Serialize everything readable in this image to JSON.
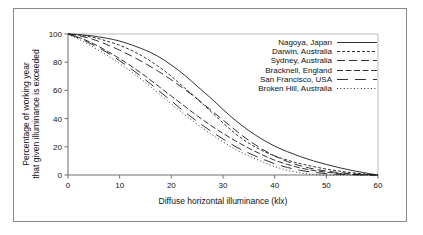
{
  "chart_data": {
    "type": "line",
    "title": "",
    "xlabel": "Diffuse horizontal illuminance (klx)",
    "ylabel_line1": "Percentage of working year",
    "ylabel_line2": "that given illuminance is exceeded",
    "xlim": [
      0,
      60
    ],
    "ylim": [
      0,
      100
    ],
    "xticks": [
      0,
      10,
      20,
      30,
      40,
      50,
      60
    ],
    "yticks": [
      0,
      20,
      40,
      60,
      80,
      100
    ],
    "grid": false,
    "legend_position": "top-right",
    "x": [
      0,
      2.5,
      5,
      7.5,
      10,
      12.5,
      15,
      17.5,
      20,
      22.5,
      25,
      27.5,
      30,
      32.5,
      35,
      37.5,
      40,
      42.5,
      45,
      47.5,
      50,
      52.5,
      55,
      57.5,
      60
    ],
    "series": [
      {
        "name": "Nagoya, Japan",
        "style": "solid",
        "dasharray": "",
        "values": [
          100,
          99.5,
          98.5,
          97,
          95,
          92,
          88.5,
          84,
          78,
          71,
          63,
          55,
          46.5,
          38.5,
          31.5,
          25.5,
          20.5,
          16.5,
          13,
          10,
          7.5,
          5.2,
          3.2,
          1.5,
          0
        ]
      },
      {
        "name": "Darwin, Australia",
        "style": "short-dash",
        "dasharray": "3,2",
        "values": [
          100,
          99,
          97.5,
          95,
          92,
          88,
          83,
          77,
          70,
          62,
          54,
          45.5,
          37,
          29,
          22.5,
          17.5,
          13.5,
          10.5,
          8,
          6,
          4.2,
          2.8,
          1.6,
          0.7,
          0
        ]
      },
      {
        "name": "Sydney, Australia",
        "style": "long-dash",
        "dasharray": "8,4",
        "values": [
          100,
          98.5,
          96,
          92.5,
          88.5,
          84,
          79,
          73.5,
          67.5,
          61,
          54,
          46.5,
          39,
          31.5,
          24.5,
          18.5,
          13.5,
          9.5,
          6.5,
          4.3,
          2.8,
          1.7,
          0.9,
          0.3,
          0
        ]
      },
      {
        "name": "Bracknell, England",
        "style": "medium-dash",
        "dasharray": "6,2.5",
        "values": [
          100,
          97,
          93,
          88,
          82.5,
          76.5,
          70,
          63,
          56,
          49,
          42,
          35.5,
          29.5,
          24,
          19,
          14.5,
          10.5,
          7.5,
          5,
          3.2,
          2,
          1.1,
          0.5,
          0.1,
          0
        ]
      },
      {
        "name": "San Francisco, USA",
        "style": "wide-long-dash",
        "dasharray": "11,7",
        "values": [
          100,
          96.5,
          92,
          87,
          81,
          74.5,
          67.5,
          60,
          52.5,
          45,
          38,
          31.5,
          25.5,
          20,
          15.5,
          11.5,
          8,
          5.3,
          3.3,
          1.9,
          1,
          0.5,
          0.2,
          0,
          0
        ]
      },
      {
        "name": "Broken Hill, Australia",
        "style": "dotted",
        "dasharray": "1,2.4",
        "values": [
          100,
          95.5,
          90.5,
          85,
          79,
          72.5,
          65.5,
          58,
          50.5,
          43,
          36,
          29.5,
          23.5,
          18,
          13.5,
          9.5,
          6,
          3.3,
          1.5,
          0.4,
          0,
          0,
          0,
          0,
          0
        ]
      }
    ]
  }
}
